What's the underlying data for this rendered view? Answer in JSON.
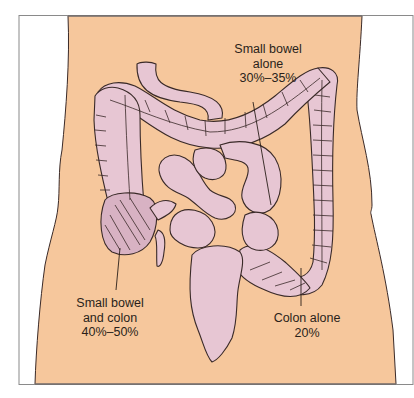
{
  "figure": {
    "colors": {
      "skin": "#F6C79C",
      "intestine": "#E7C6D3",
      "intestine_shadow": "#C9A3B4",
      "outline": "#3A2A28",
      "frame": "#8A8A8A",
      "text": "#2A1F1A"
    },
    "labels": {
      "small_bowel_alone": {
        "line1": "Small bowel",
        "line2": "alone",
        "line3": "30%–35%"
      },
      "small_bowel_and_colon": {
        "line1": "Small bowel",
        "line2": "and colon",
        "line3": "40%–50%"
      },
      "colon_alone": {
        "line1": "Colon alone",
        "line2": "20%"
      }
    }
  }
}
